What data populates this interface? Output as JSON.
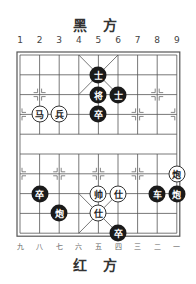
{
  "top_title": "黑 方",
  "bottom_title": "红 方",
  "top_columns": [
    "1",
    "2",
    "3",
    "4",
    "5",
    "6",
    "7",
    "8",
    "9"
  ],
  "bottom_columns": [
    "九",
    "八",
    "七",
    "六",
    "五",
    "四",
    "三",
    "二",
    "一"
  ],
  "colors": {
    "black_piece": "#1a1a1a",
    "red_piece_fill": "#ffffff",
    "grid": "#555555"
  },
  "pieces": [
    {
      "side": "black",
      "char": "士",
      "col": 5,
      "row": 1
    },
    {
      "side": "black",
      "char": "将",
      "col": 5,
      "row": 2
    },
    {
      "side": "black",
      "char": "士",
      "col": 6,
      "row": 2
    },
    {
      "side": "black",
      "char": "卒",
      "col": 5,
      "row": 3
    },
    {
      "side": "red",
      "char": "马",
      "col": 2,
      "row": 3
    },
    {
      "side": "red",
      "char": "兵",
      "col": 3,
      "row": 3
    },
    {
      "side": "red",
      "char": "炮",
      "col": 9,
      "row": 6
    },
    {
      "side": "black",
      "char": "炮",
      "col": 9,
      "row": 7
    },
    {
      "side": "black",
      "char": "卒",
      "col": 2,
      "row": 7
    },
    {
      "side": "black",
      "char": "车",
      "col": 8,
      "row": 7
    },
    {
      "side": "red",
      "char": "帅",
      "col": 5,
      "row": 7
    },
    {
      "side": "red",
      "char": "仕",
      "col": 6,
      "row": 7
    },
    {
      "side": "red",
      "char": "仕",
      "col": 5,
      "row": 8
    },
    {
      "side": "black",
      "char": "炮",
      "col": 3,
      "row": 8
    },
    {
      "side": "black",
      "char": "卒",
      "col": 6,
      "row": 9
    }
  ]
}
